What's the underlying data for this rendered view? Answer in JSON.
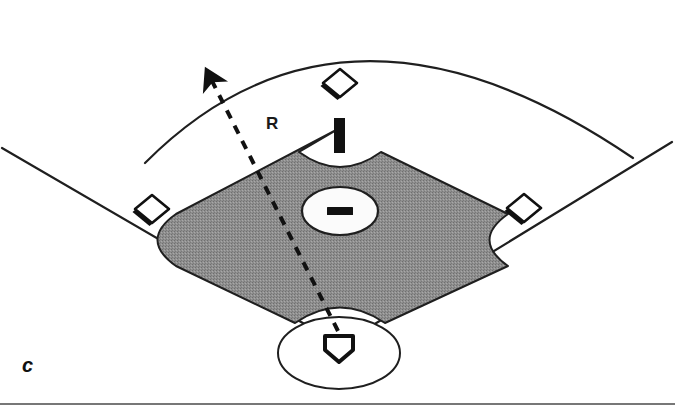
{
  "figure": {
    "panel_label": "c",
    "region_label": "R",
    "caption_rule_visible": true
  },
  "colors": {
    "infield_dirt": "#8c8c8c",
    "line_black": "#1a1a1a",
    "field_background": "#ffffff",
    "base_fill": "#ffffff",
    "rule": "#4a4a4a"
  },
  "field": {
    "outfield_fence": {
      "name": "outfield-arc",
      "apex_x": 345,
      "apex_y": 25,
      "left_end_x": 145,
      "left_end_y": 163,
      "right_end_x": 633,
      "right_end_y": 158
    },
    "foul_lines": [
      {
        "name": "left-field-foul-line",
        "x1": 2,
        "y1": 148,
        "x2": 318,
        "y2": 332
      },
      {
        "name": "right-field-foul-line",
        "x1": 672,
        "y1": 142,
        "x2": 362,
        "y2": 332
      }
    ],
    "infield_dirt": {
      "name": "infield-dirt-region",
      "top_x": 340,
      "top_y": 128,
      "left_x": 176,
      "left_y": 216,
      "bottom_x": 340,
      "bottom_y": 322,
      "right_x": 508,
      "right_y": 214,
      "notches": [
        "left-base-cutout",
        "right-base-cutout",
        "home-plate-cutout",
        "second-base-cutout"
      ]
    },
    "home_plate_circle": {
      "name": "home-plate-dirt-circle",
      "cx": 339,
      "cy": 353,
      "rx": 61,
      "ry": 36
    },
    "pitchers_mound": {
      "name": "pitchers-mound",
      "cx": 340,
      "cy": 211,
      "rx": 38,
      "ry": 24,
      "rubber": {
        "name": "pitching-rubber",
        "x": 326,
        "y": 207,
        "w": 27,
        "h": 8
      }
    },
    "bases": [
      {
        "name": "second-base",
        "cx": 340,
        "cy": 83,
        "size": 19
      },
      {
        "name": "third-base",
        "cx": 152,
        "cy": 209,
        "size": 19
      },
      {
        "name": "first-base",
        "cx": 524,
        "cy": 208,
        "size": 19
      },
      {
        "name": "home-plate",
        "cx": 339,
        "cy": 347,
        "size": 18
      }
    ],
    "second_base_post": {
      "name": "second-base-post-marker",
      "x": 334,
      "y": 118,
      "w": 11,
      "h": 35
    }
  },
  "annotation": {
    "trajectory": {
      "name": "ball-trajectory-dashed-arrow",
      "start_x": 338,
      "start_y": 332,
      "end_x": 206,
      "end_y": 70,
      "dash_pattern": "9 8",
      "stroke_width": 4,
      "arrowhead": "solid-filled"
    }
  }
}
